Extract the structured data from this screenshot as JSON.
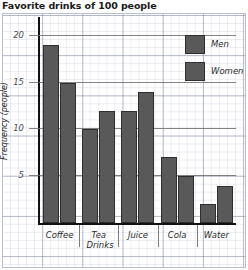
{
  "chart_data": {
    "type": "bar",
    "title": "Favorite drinks of 100 people",
    "xlabel": "Drinks",
    "ylabel": "Frequency (people)",
    "categories": [
      "Coffee",
      "Tea",
      "Juice",
      "Cola",
      "Water"
    ],
    "series": [
      {
        "name": "Men",
        "values": [
          19,
          10,
          12,
          7,
          2
        ],
        "color": "#595959"
      },
      {
        "name": "Women",
        "values": [
          15,
          12,
          14,
          5,
          4
        ],
        "color": "#595959"
      }
    ],
    "ylim": [
      0,
      22
    ],
    "yticks": [
      5,
      10,
      15,
      20
    ],
    "ytick_labels": [
      "5",
      "10",
      "15",
      "20"
    ],
    "grid": true,
    "legend_position": "top-right"
  }
}
